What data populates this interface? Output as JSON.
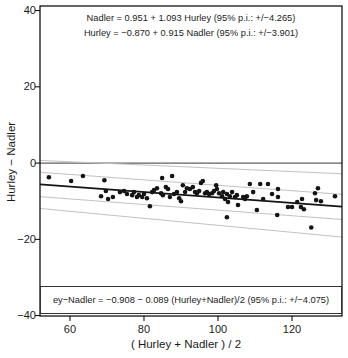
{
  "chart_data": {
    "type": "scatter",
    "title": "",
    "xlabel": "( Hurley + Nadler ) / 2",
    "ylabel": "Hurley − Nadler",
    "xlim": [
      51.9,
      133.5
    ],
    "ylim": [
      -40.1,
      41.2
    ],
    "grid": false,
    "legend": "none",
    "xticks": [
      {
        "value": 60,
        "label": "60"
      },
      {
        "value": 80,
        "label": "80"
      },
      {
        "value": 100,
        "label": "100"
      },
      {
        "value": 120,
        "label": "120"
      }
    ],
    "yticks": [
      {
        "value": 40,
        "label": "40"
      },
      {
        "value": 20,
        "label": "20"
      },
      {
        "value": 0,
        "label": "0"
      },
      {
        "value": -20,
        "label": "−20"
      },
      {
        "value": -40,
        "label": "−40"
      }
    ],
    "annotations": {
      "eq_top_1": "Nadler = 0.951 + 1.093 Hurley (95% p.i.: +/−4.265)",
      "eq_top_2": "Hurley = −0.870 + 0.915 Nadler (95% p.i.: +/−3.901)",
      "eq_bottom": "ey−Nadler = −0.908 − 0.089 (Hurley+Nadler)/2 (95% p.i.: +/−4.075)"
    },
    "colors": {
      "point": "#141414",
      "regression_line": "#141414",
      "zero_line": "#606060",
      "band_line": "#c2c2c2",
      "border": "#000000",
      "background": "#ffffff"
    },
    "lines": [
      {
        "name": "zero-line",
        "x1": 51.9,
        "y1": 0,
        "x2": 133.5,
        "y2": 0,
        "role": "reference",
        "width": 1.2
      },
      {
        "name": "upper-outer-band",
        "x1": 51.9,
        "y1": 0.7,
        "x2": 133.5,
        "y2": -2.8,
        "role": "band",
        "width": 1
      },
      {
        "name": "upper-inner-band",
        "x1": 51.9,
        "y1": -2.4,
        "x2": 133.5,
        "y2": -8.2,
        "role": "band",
        "width": 1
      },
      {
        "name": "regression-line",
        "x1": 51.9,
        "y1": -5.6,
        "x2": 133.5,
        "y2": -11.4,
        "role": "regression",
        "width": 1.8
      },
      {
        "name": "lower-inner-band",
        "x1": 51.9,
        "y1": -8.8,
        "x2": 133.5,
        "y2": -14.8,
        "role": "band",
        "width": 1
      },
      {
        "name": "lower-outer-band",
        "x1": 51.9,
        "y1": -11.9,
        "x2": 133.5,
        "y2": -19.4,
        "role": "band",
        "width": 1
      }
    ],
    "points": [
      [
        54.3,
        -3.7
      ],
      [
        60.3,
        -4.7
      ],
      [
        63.5,
        -3.4
      ],
      [
        69.3,
        -4.5
      ],
      [
        68.4,
        -8.7
      ],
      [
        69.7,
        -7.3
      ],
      [
        70.3,
        -9.4
      ],
      [
        71.6,
        -8.9
      ],
      [
        73.5,
        -7.6
      ],
      [
        74.6,
        -7.3
      ],
      [
        75.4,
        -8.1
      ],
      [
        76.8,
        -8.4
      ],
      [
        77.3,
        -7.6
      ],
      [
        78.1,
        -8.9
      ],
      [
        78.6,
        -8.4
      ],
      [
        79.5,
        -8.9
      ],
      [
        80.0,
        -8.1
      ],
      [
        80.8,
        -9.2
      ],
      [
        81.6,
        -11.3
      ],
      [
        82.2,
        -7.6
      ],
      [
        82.7,
        -7.1
      ],
      [
        83.5,
        -6.6
      ],
      [
        84.6,
        -7.9
      ],
      [
        85.1,
        -8.4
      ],
      [
        84.9,
        -3.9
      ],
      [
        85.9,
        -6.3
      ],
      [
        86.5,
        -6.8
      ],
      [
        87.0,
        -8.9
      ],
      [
        87.6,
        -3.4
      ],
      [
        88.1,
        -8.1
      ],
      [
        88.9,
        -7.6
      ],
      [
        89.5,
        -9.2
      ],
      [
        90.0,
        -10.0
      ],
      [
        90.5,
        -5.8
      ],
      [
        91.1,
        -7.6
      ],
      [
        91.6,
        -6.6
      ],
      [
        92.4,
        -6.8
      ],
      [
        93.2,
        -6.3
      ],
      [
        93.8,
        -7.6
      ],
      [
        94.3,
        -7.9
      ],
      [
        94.9,
        -7.3
      ],
      [
        95.4,
        -5.2
      ],
      [
        95.9,
        -4.7
      ],
      [
        96.5,
        -7.9
      ],
      [
        97.0,
        -7.6
      ],
      [
        97.6,
        -8.1
      ],
      [
        98.4,
        -7.9
      ],
      [
        98.9,
        -7.3
      ],
      [
        99.5,
        -5.8
      ],
      [
        99.7,
        -6.8
      ],
      [
        100.3,
        -7.9
      ],
      [
        101.1,
        -8.7
      ],
      [
        101.4,
        -7.6
      ],
      [
        101.9,
        -9.4
      ],
      [
        102.4,
        -8.1
      ],
      [
        102.7,
        -10.2
      ],
      [
        103.2,
        -8.7
      ],
      [
        103.8,
        -7.6
      ],
      [
        104.6,
        -8.9
      ],
      [
        105.1,
        -8.4
      ],
      [
        105.4,
        -11.0
      ],
      [
        102.4,
        -14.2
      ],
      [
        106.8,
        -8.9
      ],
      [
        107.3,
        -9.4
      ],
      [
        107.8,
        -8.7
      ],
      [
        108.6,
        -5.5
      ],
      [
        109.5,
        -7.6
      ],
      [
        110.5,
        -12.3
      ],
      [
        111.4,
        -5.5
      ],
      [
        112.2,
        -9.4
      ],
      [
        113.5,
        -5.5
      ],
      [
        114.6,
        -8.1
      ],
      [
        116.2,
        -6.8
      ],
      [
        116.2,
        -8.9
      ],
      [
        116.0,
        -13.6
      ],
      [
        118.9,
        -11.5
      ],
      [
        120.0,
        -11.5
      ],
      [
        121.4,
        -10.2
      ],
      [
        122.4,
        -11.5
      ],
      [
        122.7,
        -9.4
      ],
      [
        123.2,
        -12.1
      ],
      [
        126.2,
        -7.9
      ],
      [
        125.2,
        -16.9
      ],
      [
        127.0,
        -6.6
      ],
      [
        126.5,
        -9.7
      ],
      [
        127.8,
        -10.0
      ],
      [
        131.6,
        -8.7
      ]
    ]
  }
}
